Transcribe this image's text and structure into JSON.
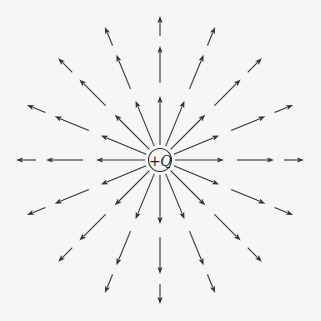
{
  "diagram": {
    "width": 321,
    "height": 321,
    "background_color": "#f6f6f5",
    "line_color": "#333333",
    "charge": {
      "sign": "+",
      "symbol": "Q",
      "center_x": 160,
      "center_y": 160,
      "radius": 11.5,
      "stroke_color": "#333333"
    },
    "field_lines": {
      "count": 16,
      "angle_step_deg": 22.5,
      "start_angle_deg": 0,
      "direction": "outward",
      "segments": [
        {
          "r_start": 15,
          "r_end": 64
        },
        {
          "r_start": 77,
          "r_end": 114
        },
        {
          "r_start": 124,
          "r_end": 144
        }
      ],
      "arrowhead": {
        "length": 7,
        "half_width": 2.6
      }
    }
  }
}
